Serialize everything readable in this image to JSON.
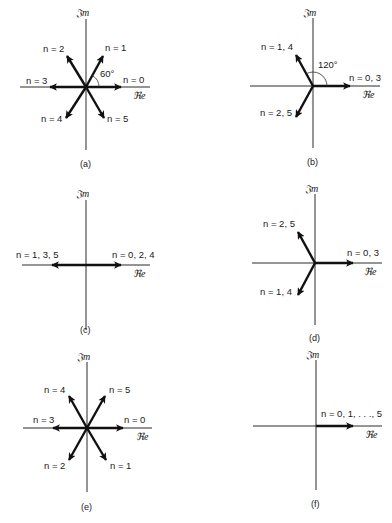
{
  "figure": {
    "axis_labels": {
      "real": "ℜe",
      "imag": "𝔍m"
    },
    "panels": [
      {
        "id": "a",
        "caption": "(a)",
        "angle_label": "60°",
        "vectors": [
          {
            "label": "n = 0",
            "angle_deg": 0
          },
          {
            "label": "n = 1",
            "angle_deg": 60
          },
          {
            "label": "n = 2",
            "angle_deg": 120
          },
          {
            "label": "n = 3",
            "angle_deg": 180
          },
          {
            "label": "n = 4",
            "angle_deg": 240
          },
          {
            "label": "n = 5",
            "angle_deg": 300
          }
        ]
      },
      {
        "id": "b",
        "caption": "(b)",
        "angle_label": "120°",
        "vectors": [
          {
            "label": "n = 0, 3",
            "angle_deg": 0
          },
          {
            "label": "n = 1, 4",
            "angle_deg": 120
          },
          {
            "label": "n = 2, 5",
            "angle_deg": 240
          }
        ]
      },
      {
        "id": "c",
        "caption": "(c)",
        "vectors": [
          {
            "label": "n = 0, 2, 4",
            "angle_deg": 0
          },
          {
            "label": "n = 1, 3, 5",
            "angle_deg": 180
          }
        ]
      },
      {
        "id": "d",
        "caption": "(d)",
        "vectors": [
          {
            "label": "n = 0, 3",
            "angle_deg": 0
          },
          {
            "label": "n = 2, 5",
            "angle_deg": 120
          },
          {
            "label": "n = 1, 4",
            "angle_deg": 240
          }
        ]
      },
      {
        "id": "e",
        "caption": "(e)",
        "vectors": [
          {
            "label": "n = 0",
            "angle_deg": 0
          },
          {
            "label": "n = 5",
            "angle_deg": 60
          },
          {
            "label": "n = 4",
            "angle_deg": 120
          },
          {
            "label": "n = 3",
            "angle_deg": 180
          },
          {
            "label": "n = 2",
            "angle_deg": 240
          },
          {
            "label": "n = 1",
            "angle_deg": 300
          }
        ]
      },
      {
        "id": "f",
        "caption": "(f)",
        "vectors": [
          {
            "label": "n = 0, 1, . . ., 5",
            "angle_deg": 0
          }
        ]
      }
    ]
  }
}
